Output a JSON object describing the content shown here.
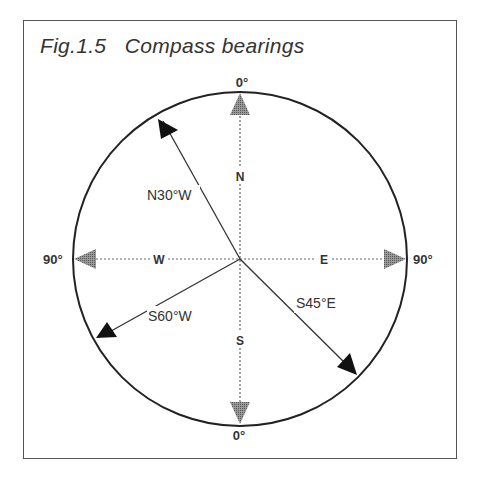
{
  "figure": {
    "title": "Fig.1.5   Compass bearings"
  },
  "compass": {
    "cardinal": {
      "north": "N",
      "south": "S",
      "east": "E",
      "west": "W"
    },
    "degree_labels": {
      "top": "0°",
      "bottom": "0°",
      "left": "90°",
      "right": "90°"
    },
    "bearings": [
      {
        "label": "N30°W",
        "from": "N",
        "angle_deg": 30,
        "toward": "W"
      },
      {
        "label": "S45°E",
        "from": "S",
        "angle_deg": 45,
        "toward": "E"
      },
      {
        "label": "S60°W",
        "from": "S",
        "angle_deg": 60,
        "toward": "W"
      }
    ]
  },
  "colors": {
    "line": "#222222",
    "axis_arrow": "#888888",
    "frame": "#555555",
    "text": "#333333"
  }
}
